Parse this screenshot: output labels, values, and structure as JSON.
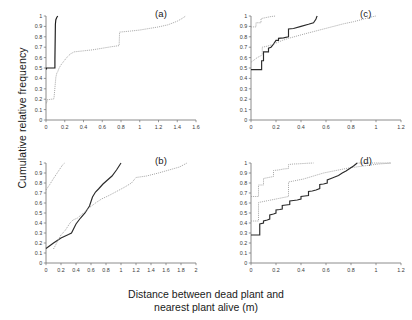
{
  "figure": {
    "xlabel_line1": "Distance between dead plant and",
    "xlabel_line2": "nearest plant alive (m)",
    "ylabel": "Cumulative relative frequency"
  },
  "panels": {
    "a": {
      "label": "(a)"
    },
    "b": {
      "label": "(b)"
    },
    "c": {
      "label": "(c)"
    },
    "d": {
      "label": "(d)"
    }
  },
  "chart_data": [
    {
      "id": "a",
      "type": "line",
      "title": "(a)",
      "xlabel": "Distance between dead plant and nearest plant alive (m)",
      "ylabel": "Cumulative relative frequency",
      "xlim": [
        0,
        1.6
      ],
      "ylim": [
        0,
        1
      ],
      "xticks": [
        0,
        0.2,
        0.4,
        0.6,
        0.8,
        1,
        1.2,
        1.4,
        1.6
      ],
      "xticklabels": [
        "0",
        "0.2",
        "0.4",
        "0.6",
        "0.8",
        "1",
        "1.2",
        "1.4",
        "1.6"
      ],
      "yticks": [
        0,
        0.1,
        0.2,
        0.3,
        0.4,
        0.5,
        0.6,
        0.7,
        0.8,
        0.9,
        1
      ],
      "yticklabels": [
        "0",
        "0.1",
        "0.2",
        "0.3",
        "0.4",
        "0.5",
        "0.6",
        "0.7",
        "0.8",
        "0.9",
        "1"
      ],
      "grid": false,
      "legend": "none",
      "series": [
        {
          "name": "solid-black",
          "style": "solid",
          "color": "#1a1a1a",
          "x": [
            0.0,
            0.005,
            0.005,
            0.095,
            0.095,
            0.1,
            0.105,
            0.115,
            0.125
          ],
          "y": [
            0.49,
            0.49,
            0.5,
            0.5,
            0.58,
            0.92,
            0.965,
            0.985,
            1.0
          ]
        },
        {
          "name": "dotted-gray",
          "style": "dotted",
          "color": "#9a9a9a",
          "x": [
            0.0,
            0.01,
            0.01,
            0.03,
            0.05,
            0.07,
            0.085,
            0.095,
            0.105,
            0.115,
            0.125,
            0.14,
            0.16,
            0.19,
            0.22,
            0.26,
            0.3,
            0.4,
            0.5,
            0.6,
            0.7,
            0.78,
            0.785,
            0.9,
            1.0,
            1.1,
            1.2,
            1.3,
            1.4,
            1.45,
            1.49
          ],
          "y": [
            0.165,
            0.165,
            0.195,
            0.195,
            0.2,
            0.2,
            0.205,
            0.31,
            0.41,
            0.45,
            0.465,
            0.5,
            0.53,
            0.565,
            0.6,
            0.635,
            0.655,
            0.665,
            0.675,
            0.69,
            0.705,
            0.715,
            0.845,
            0.855,
            0.865,
            0.88,
            0.895,
            0.915,
            0.95,
            0.975,
            1.0
          ]
        }
      ]
    },
    {
      "id": "b",
      "type": "line",
      "title": "(b)",
      "xlabel": "Distance between dead plant and nearest plant alive (m)",
      "ylabel": "Cumulative relative frequency",
      "xlim": [
        0,
        2
      ],
      "ylim": [
        0,
        1
      ],
      "xticks": [
        0,
        0.2,
        0.4,
        0.6,
        0.8,
        1,
        1.2,
        1.4,
        1.6,
        1.8,
        2
      ],
      "xticklabels": [
        "0",
        "0.2",
        "0.4",
        "0.6",
        "0.8",
        "1",
        "1.2",
        "1.4",
        "1.6",
        "1.8",
        "2"
      ],
      "yticks": [
        0,
        0.1,
        0.2,
        0.3,
        0.4,
        0.5,
        0.6,
        0.7,
        0.8,
        0.9,
        1
      ],
      "yticklabels": [
        "0",
        "0.1",
        "0.2",
        "0.3",
        "0.4",
        "0.5",
        "0.6",
        "0.7",
        "0.8",
        "0.9",
        "1"
      ],
      "grid": false,
      "legend": "none",
      "series": [
        {
          "name": "dotted-gray-steep",
          "style": "dotted",
          "color": "#9a9a9a",
          "x": [
            0.0,
            0.05,
            0.1,
            0.14,
            0.18,
            0.22,
            0.25
          ],
          "y": [
            0.73,
            0.785,
            0.845,
            0.89,
            0.935,
            0.98,
            1.0
          ]
        },
        {
          "name": "solid-black",
          "style": "solid",
          "color": "#2a2a2a",
          "x": [
            0.0,
            0.1,
            0.2,
            0.3,
            0.34,
            0.4,
            0.46,
            0.52,
            0.58,
            0.62,
            0.66,
            0.7,
            0.76,
            0.82,
            0.88,
            0.94,
            1.0
          ],
          "y": [
            0.145,
            0.2,
            0.25,
            0.285,
            0.3,
            0.39,
            0.45,
            0.5,
            0.57,
            0.66,
            0.71,
            0.74,
            0.79,
            0.83,
            0.87,
            0.93,
            1.0
          ]
        },
        {
          "name": "dotted-gray-long",
          "style": "dotted",
          "color": "#9a9a9a",
          "x": [
            0.1,
            0.16,
            0.2,
            0.26,
            0.32,
            0.36,
            0.42,
            0.5,
            0.58,
            0.66,
            0.74,
            0.84,
            0.94,
            1.04,
            1.14,
            1.2,
            1.34,
            1.5,
            1.64,
            1.78,
            1.88
          ],
          "y": [
            0.14,
            0.225,
            0.28,
            0.33,
            0.4,
            0.43,
            0.45,
            0.5,
            0.555,
            0.6,
            0.64,
            0.675,
            0.715,
            0.755,
            0.8,
            0.855,
            0.87,
            0.9,
            0.93,
            0.96,
            1.0
          ]
        }
      ]
    },
    {
      "id": "c",
      "type": "line",
      "title": "(c)",
      "xlabel": "Distance between dead plant and nearest plant alive (m)",
      "ylabel": "Cumulative relative frequency",
      "xlim": [
        0,
        1.2
      ],
      "ylim": [
        0,
        1
      ],
      "xticks": [
        0,
        0.2,
        0.4,
        0.6,
        0.8,
        1,
        1.2
      ],
      "xticklabels": [
        "0",
        "0.2",
        "0.4",
        "0.6",
        "0.8",
        "1",
        "1.2"
      ],
      "yticks": [
        0,
        0.1,
        0.2,
        0.3,
        0.4,
        0.5,
        0.6,
        0.7,
        0.8,
        0.9,
        1
      ],
      "yticklabels": [
        "0",
        "0.1",
        "0.2",
        "0.3",
        "0.4",
        "0.5",
        "0.6",
        "0.7",
        "0.8",
        "0.9",
        "1"
      ],
      "grid": false,
      "legend": "none",
      "series": [
        {
          "name": "dotted-gray-steep",
          "style": "dotted",
          "color": "#9a9a9a",
          "x": [
            0.0,
            0.04,
            0.04,
            0.08,
            0.08,
            0.12,
            0.16,
            0.2
          ],
          "y": [
            0.895,
            0.895,
            0.935,
            0.935,
            0.975,
            0.985,
            0.995,
            1.0
          ]
        },
        {
          "name": "solid-black",
          "style": "solid",
          "color": "#2a2a2a",
          "x": [
            0.0,
            0.085,
            0.085,
            0.1,
            0.1,
            0.12,
            0.14,
            0.14,
            0.16,
            0.18,
            0.2,
            0.22,
            0.22,
            0.26,
            0.3,
            0.3,
            0.34,
            0.4,
            0.46,
            0.5,
            0.52,
            0.525,
            0.53
          ],
          "y": [
            0.485,
            0.485,
            0.57,
            0.57,
            0.655,
            0.655,
            0.655,
            0.69,
            0.7,
            0.73,
            0.765,
            0.765,
            0.785,
            0.79,
            0.8,
            0.875,
            0.88,
            0.9,
            0.92,
            0.935,
            0.97,
            0.99,
            1.0
          ]
        },
        {
          "name": "dotted-gray-long",
          "style": "dotted",
          "color": "#9a9a9a",
          "x": [
            0.0,
            0.05,
            0.09,
            0.09,
            0.13,
            0.17,
            0.21,
            0.25,
            0.3,
            0.36,
            0.42,
            0.5,
            0.58,
            0.66,
            0.74,
            0.82,
            0.9,
            0.96,
            1.0
          ],
          "y": [
            0.555,
            0.6,
            0.625,
            0.7,
            0.71,
            0.725,
            0.745,
            0.765,
            0.785,
            0.805,
            0.825,
            0.85,
            0.875,
            0.9,
            0.925,
            0.945,
            0.97,
            0.99,
            1.0
          ]
        }
      ]
    },
    {
      "id": "d",
      "type": "line",
      "title": "(d)",
      "xlabel": "Distance between dead plant and nearest plant alive (m)",
      "ylabel": "Cumulative relative frequency",
      "xlim": [
        0,
        1.2
      ],
      "ylim": [
        0,
        1
      ],
      "xticks": [
        0,
        0.2,
        0.4,
        0.6,
        0.8,
        1,
        1.2
      ],
      "xticklabels": [
        "0",
        "0.2",
        "0.4",
        "0.6",
        "0.8",
        "1",
        "1.2"
      ],
      "yticks": [
        0,
        0.1,
        0.2,
        0.3,
        0.4,
        0.5,
        0.6,
        0.7,
        0.8,
        0.9,
        1
      ],
      "yticklabels": [
        "0",
        "0.1",
        "0.2",
        "0.3",
        "0.4",
        "0.5",
        "0.6",
        "0.7",
        "0.8",
        "0.9",
        "1"
      ],
      "grid": false,
      "legend": "none",
      "series": [
        {
          "name": "dotted-gray-upper",
          "style": "dotted",
          "color": "#9a9a9a",
          "x": [
            0.0,
            0.06,
            0.06,
            0.1,
            0.1,
            0.14,
            0.18,
            0.18,
            0.22,
            0.26,
            0.3,
            0.3,
            0.34,
            0.38,
            0.42,
            0.46,
            0.48,
            0.5
          ],
          "y": [
            0.665,
            0.665,
            0.78,
            0.78,
            0.845,
            0.855,
            0.865,
            0.925,
            0.93,
            0.94,
            0.945,
            0.985,
            0.99,
            0.992,
            0.995,
            0.998,
            0.999,
            1.0
          ]
        },
        {
          "name": "dotted-gray-middle",
          "style": "dotted",
          "color": "#9a9a9a",
          "x": [
            0.0,
            0.06,
            0.06,
            0.1,
            0.14,
            0.18,
            0.22,
            0.26,
            0.3,
            0.3,
            0.34,
            0.38,
            0.42,
            0.46,
            0.5,
            0.54,
            0.58,
            0.62,
            0.66,
            0.72,
            0.78,
            0.84,
            0.9,
            0.96,
            1.02,
            1.08,
            1.12
          ],
          "y": [
            0.42,
            0.42,
            0.605,
            0.615,
            0.625,
            0.635,
            0.645,
            0.655,
            0.665,
            0.81,
            0.82,
            0.83,
            0.84,
            0.855,
            0.87,
            0.885,
            0.9,
            0.91,
            0.92,
            0.935,
            0.95,
            0.96,
            0.97,
            0.98,
            0.99,
            0.995,
            1.0
          ]
        },
        {
          "name": "solid-black",
          "style": "solid",
          "color": "#2a2a2a",
          "x": [
            0.0,
            0.07,
            0.07,
            0.1,
            0.1,
            0.13,
            0.15,
            0.15,
            0.18,
            0.2,
            0.2,
            0.23,
            0.25,
            0.25,
            0.28,
            0.31,
            0.31,
            0.34,
            0.37,
            0.4,
            0.4,
            0.43,
            0.46,
            0.46,
            0.49,
            0.52,
            0.55,
            0.55,
            0.58,
            0.61,
            0.61,
            0.64,
            0.67,
            0.7,
            0.73,
            0.76,
            0.79,
            0.82,
            0.85
          ],
          "y": [
            0.28,
            0.28,
            0.39,
            0.4,
            0.42,
            0.43,
            0.44,
            0.48,
            0.49,
            0.5,
            0.53,
            0.535,
            0.54,
            0.575,
            0.58,
            0.585,
            0.62,
            0.625,
            0.63,
            0.64,
            0.665,
            0.67,
            0.675,
            0.715,
            0.72,
            0.73,
            0.745,
            0.785,
            0.79,
            0.8,
            0.83,
            0.845,
            0.86,
            0.875,
            0.9,
            0.92,
            0.945,
            0.97,
            1.0
          ]
        },
        {
          "name": "dotted-gray-tail",
          "style": "dotted",
          "color": "#9a9a9a",
          "x": [
            0.85,
            0.92,
            1.0,
            1.06,
            1.12
          ],
          "y": [
            1.0,
            1.0,
            1.0,
            1.0,
            1.0
          ]
        }
      ]
    }
  ]
}
